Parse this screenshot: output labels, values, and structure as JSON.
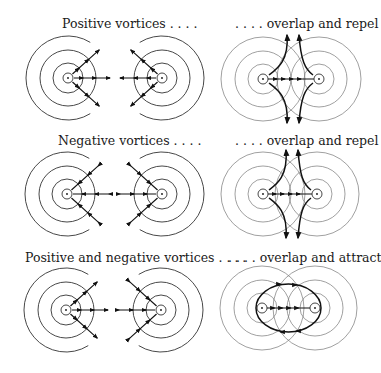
{
  "figure": {
    "rows": [
      {
        "left_label": "Positive vortices . . . .",
        "right_label": ". . . . overlap and repel",
        "left_vortex_signs": [
          "+",
          "+"
        ],
        "interaction": "repel"
      },
      {
        "left_label": "Negative vortices . . . .",
        "right_label": ". . . . overlap and repel",
        "left_vortex_signs": [
          "-",
          "-"
        ],
        "interaction": "repel"
      },
      {
        "left_label": "Positive and negative vortices . . . .",
        "right_label": ". . . . overlap and attract",
        "left_vortex_signs": [
          "+",
          "-"
        ],
        "interaction": "attract"
      }
    ]
  }
}
